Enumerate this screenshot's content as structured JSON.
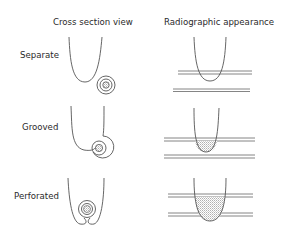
{
  "headers": {
    "cross_section": "Cross section view",
    "radiographic": "Radiographic appearance"
  },
  "rows": [
    {
      "label": "Separate",
      "cross_section": "root-with-separate-canal",
      "radiographic": "root-between-film-lines-no-shadow"
    },
    {
      "label": "Grooved",
      "cross_section": "root-with-grooved-canal",
      "radiographic": "root-with-small-stippled-shadow"
    },
    {
      "label": "Perforated",
      "cross_section": "root-with-perforated-canal",
      "radiographic": "root-with-large-stippled-shadow"
    }
  ],
  "colors": {
    "line": "#555555",
    "film_line": "#777777",
    "stipple": "#bdbdbd",
    "background": "#ffffff"
  }
}
